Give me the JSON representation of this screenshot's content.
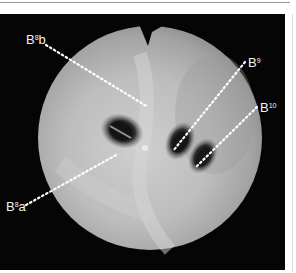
{
  "figure": {
    "labels": [
      {
        "id": "b8b",
        "base": "B",
        "sup": "8",
        "suffix": "b"
      },
      {
        "id": "b9",
        "base": "B",
        "sup": "9",
        "suffix": ""
      },
      {
        "id": "b10",
        "base": "B",
        "sup": "10",
        "suffix": ""
      },
      {
        "id": "b8a",
        "base": "B",
        "sup": "8",
        "suffix": "a"
      }
    ]
  },
  "colors": {
    "background": "#050505",
    "mucosa_light": "#d9d9d9",
    "mucosa_mid": "#a8a8a8",
    "lumen_dark": "#1a1a1a",
    "label": "#f2f2f2"
  }
}
